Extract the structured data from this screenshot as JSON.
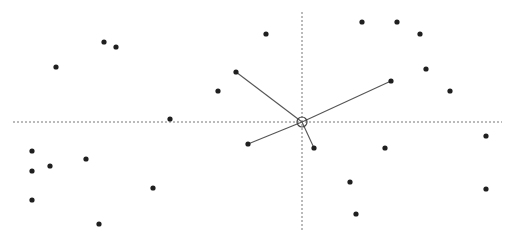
{
  "canvas": {
    "width": 516,
    "height": 244,
    "background": "#ffffff"
  },
  "colors": {
    "point": "#1f1f1f",
    "link": "#555555",
    "axis": "#777777",
    "center": "#444444"
  },
  "axes": {
    "horizontal": {
      "x1": 13,
      "x2": 502,
      "y": 122
    },
    "vertical": {
      "x": 302,
      "y1": 12,
      "y2": 232
    }
  },
  "center": {
    "x": 302,
    "y": 122,
    "r": 5
  },
  "points": [
    {
      "x": 104,
      "y": 42
    },
    {
      "x": 116,
      "y": 47
    },
    {
      "x": 56,
      "y": 67
    },
    {
      "x": 170,
      "y": 119
    },
    {
      "x": 32,
      "y": 151
    },
    {
      "x": 86,
      "y": 159
    },
    {
      "x": 50,
      "y": 166
    },
    {
      "x": 32,
      "y": 171
    },
    {
      "x": 32,
      "y": 200
    },
    {
      "x": 153,
      "y": 188
    },
    {
      "x": 99,
      "y": 224
    },
    {
      "x": 266,
      "y": 34
    },
    {
      "x": 236,
      "y": 72
    },
    {
      "x": 218,
      "y": 91
    },
    {
      "x": 248,
      "y": 144
    },
    {
      "x": 314,
      "y": 148
    },
    {
      "x": 362,
      "y": 22
    },
    {
      "x": 397,
      "y": 22
    },
    {
      "x": 420,
      "y": 34
    },
    {
      "x": 426,
      "y": 69
    },
    {
      "x": 391,
      "y": 81
    },
    {
      "x": 450,
      "y": 91
    },
    {
      "x": 486,
      "y": 136
    },
    {
      "x": 385,
      "y": 148
    },
    {
      "x": 350,
      "y": 182
    },
    {
      "x": 486,
      "y": 189
    },
    {
      "x": 356,
      "y": 214
    }
  ],
  "links": [
    {
      "x": 236,
      "y": 72
    },
    {
      "x": 391,
      "y": 81
    },
    {
      "x": 248,
      "y": 144
    },
    {
      "x": 314,
      "y": 148
    }
  ]
}
